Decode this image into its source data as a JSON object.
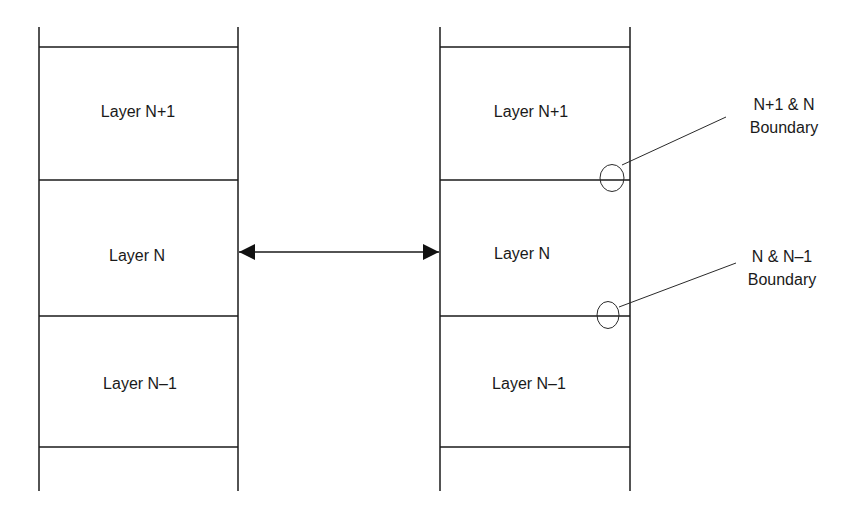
{
  "diagram": {
    "left_stack": {
      "layers": [
        {
          "label": "Layer N+1"
        },
        {
          "label": "Layer N"
        },
        {
          "label": "Layer N–1"
        }
      ]
    },
    "right_stack": {
      "layers": [
        {
          "label": "Layer N+1"
        },
        {
          "label": "Layer N"
        },
        {
          "label": "Layer N–1"
        }
      ]
    },
    "arrow": {
      "type": "bidirectional",
      "from": "left Layer N",
      "to": "right Layer N"
    },
    "callouts": [
      {
        "line1": "N+1 & N",
        "line2": "Boundary"
      },
      {
        "line1": "N & N–1",
        "line2": "Boundary"
      }
    ],
    "colors": {
      "stroke": "#1a1a1a",
      "background": "#ffffff"
    }
  }
}
